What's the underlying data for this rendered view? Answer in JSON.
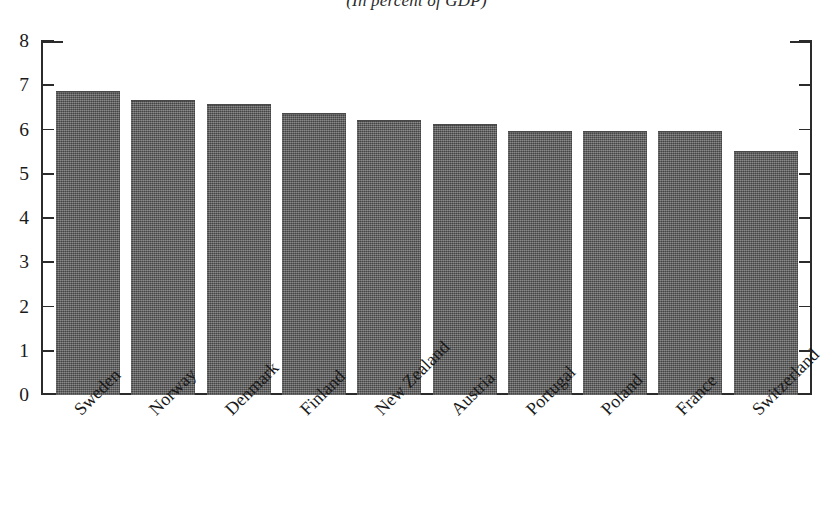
{
  "figure": {
    "subtitle": "(In percent of GDP)"
  },
  "chart_data": {
    "type": "bar",
    "title": "",
    "subtitle": "(In percent of GDP)",
    "xlabel": "",
    "ylabel": "",
    "ylim": [
      0,
      8
    ],
    "yticks": [
      "8",
      "7",
      "6",
      "5",
      "4",
      "3",
      "2",
      "1",
      "0"
    ],
    "ytick_values": [
      8,
      7,
      6,
      5,
      4,
      3,
      2,
      1,
      0
    ],
    "grid": false,
    "legend": "none",
    "bar_color": "#5e5e5e",
    "categories": [
      "Sweden",
      "Norway",
      "Denmark",
      "Finland",
      "New Zealand",
      "Austria",
      "Portugal",
      "Poland",
      "France",
      "Switzerland"
    ],
    "values": [
      6.85,
      6.65,
      6.55,
      6.35,
      6.2,
      6.1,
      5.95,
      5.95,
      5.95,
      5.5
    ]
  }
}
